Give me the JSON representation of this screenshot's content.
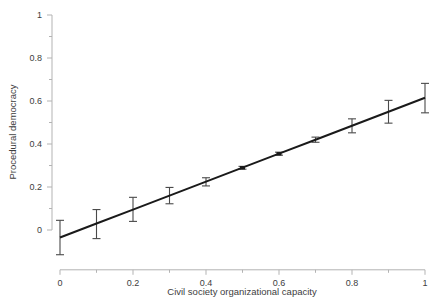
{
  "chart_data": {
    "type": "line",
    "title": "",
    "subtitle": "",
    "xlabel": "Civil society organizational capacity",
    "ylabel": "Procedural democracy",
    "xlim": [
      0,
      1
    ],
    "ylim": [
      -0.12,
      1
    ],
    "grid": false,
    "legend": null,
    "x_ticks": [
      0,
      0.2,
      0.4,
      0.6,
      0.8,
      1
    ],
    "x_tick_labels": [
      "0",
      "0.2",
      "0.4",
      "0.6",
      "0.8",
      "1"
    ],
    "x_minor_ticks": [
      0.1,
      0.3,
      0.5,
      0.7,
      0.9
    ],
    "y_ticks": [
      0,
      0.2,
      0.4,
      0.6,
      0.8,
      1
    ],
    "y_tick_labels": [
      "0",
      "0.2",
      "0.4",
      "0.6",
      "0.8",
      "1"
    ],
    "y_minor_ticks": [
      0.1,
      0.3,
      0.5,
      0.7,
      0.9
    ],
    "x": [
      0,
      0.1,
      0.2,
      0.3,
      0.4,
      0.5,
      0.6,
      0.7,
      0.8,
      0.9,
      1
    ],
    "series": [
      {
        "name": "Predicted procedural democracy",
        "values": [
          -0.035,
          0.03,
          0.095,
          0.16,
          0.225,
          0.29,
          0.355,
          0.42,
          0.485,
          0.55,
          0.615
        ],
        "error_low": [
          -0.115,
          -0.04,
          0.04,
          0.122,
          0.205,
          0.283,
          0.348,
          0.408,
          0.452,
          0.497,
          0.545
        ],
        "error_high": [
          0.045,
          0.095,
          0.152,
          0.198,
          0.243,
          0.296,
          0.362,
          0.432,
          0.517,
          0.603,
          0.682
        ],
        "line_color": "#1a1a1a",
        "error_color": "#4a4a4a"
      }
    ],
    "axis_color": "#b3b3b3",
    "text_color": "#3d3d3d",
    "background": "#ffffff"
  }
}
